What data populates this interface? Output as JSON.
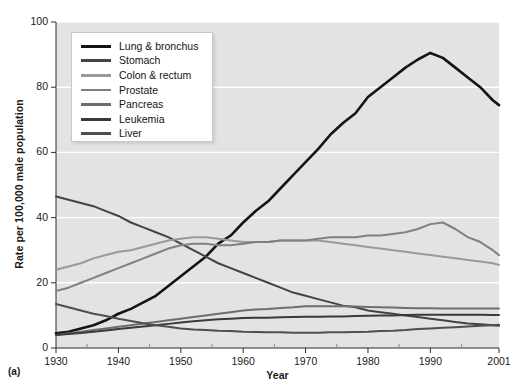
{
  "figure": {
    "panel_label": "(a)",
    "background_color": "#e3e3e3",
    "gridline_color": "#ffffff"
  },
  "chart_data": {
    "type": "line",
    "title": "",
    "xlabel": "Year",
    "ylabel": "Rate per 100,000 male population",
    "xlim": [
      1930,
      2001
    ],
    "ylim": [
      0,
      100
    ],
    "xticks": [
      1930,
      1940,
      1950,
      1960,
      1970,
      1980,
      1990,
      2001
    ],
    "yticks": [
      0,
      20,
      40,
      60,
      80,
      100
    ],
    "grid": "horizontal",
    "legend_position": "upper-left-inside",
    "x": [
      1930,
      1932,
      1934,
      1936,
      1938,
      1940,
      1942,
      1944,
      1946,
      1948,
      1950,
      1952,
      1954,
      1956,
      1958,
      1960,
      1962,
      1964,
      1966,
      1968,
      1970,
      1972,
      1974,
      1976,
      1978,
      1980,
      1982,
      1984,
      1986,
      1988,
      1990,
      1992,
      1994,
      1996,
      1998,
      2000,
      2001
    ],
    "series": [
      {
        "name": "Lung & bronchus",
        "color": "#141414",
        "values": [
          4.5,
          5.0,
          6.0,
          7.0,
          8.5,
          10.5,
          12.0,
          14.0,
          16.0,
          19.0,
          22.0,
          25.0,
          28.0,
          32.0,
          34.5,
          38.5,
          42.0,
          45.0,
          49.0,
          53.0,
          57.0,
          61.0,
          65.5,
          69.0,
          72.0,
          77.0,
          80.0,
          83.0,
          86.0,
          88.5,
          90.5,
          89.0,
          86.0,
          83.0,
          80.0,
          76.0,
          74.5
        ]
      },
      {
        "name": "Stomach",
        "color": "#434343",
        "values": [
          46.5,
          45.5,
          44.5,
          43.5,
          42.0,
          40.5,
          38.5,
          37.0,
          35.5,
          34.0,
          32.0,
          30.0,
          28.0,
          26.0,
          24.5,
          23.0,
          21.5,
          20.0,
          18.5,
          17.0,
          16.0,
          15.0,
          14.0,
          13.0,
          12.5,
          11.5,
          11.0,
          10.5,
          10.0,
          9.5,
          9.0,
          8.5,
          8.0,
          7.5,
          7.3,
          7.0,
          6.8
        ]
      },
      {
        "name": "Colon & rectum",
        "color": "#999999",
        "values": [
          24.0,
          25.0,
          26.0,
          27.5,
          28.5,
          29.5,
          30.0,
          31.0,
          32.0,
          33.0,
          33.5,
          34.0,
          34.0,
          33.5,
          33.0,
          32.5,
          32.5,
          32.5,
          33.0,
          33.0,
          33.0,
          33.0,
          32.5,
          32.0,
          31.5,
          31.0,
          30.5,
          30.0,
          29.5,
          29.0,
          28.5,
          28.0,
          27.5,
          27.0,
          26.5,
          26.0,
          25.5
        ]
      },
      {
        "name": "Prostate",
        "color": "#808080",
        "values": [
          17.5,
          18.5,
          20.0,
          21.5,
          23.0,
          24.5,
          26.0,
          27.5,
          29.0,
          30.5,
          31.5,
          32.0,
          32.0,
          31.5,
          31.5,
          32.0,
          32.5,
          32.5,
          33.0,
          33.0,
          33.0,
          33.5,
          34.0,
          34.0,
          34.0,
          34.5,
          34.5,
          35.0,
          35.5,
          36.5,
          38.0,
          38.5,
          36.5,
          34.0,
          32.5,
          30.0,
          28.5
        ]
      },
      {
        "name": "Pancreas",
        "color": "#6e6e6e",
        "values": [
          4.0,
          4.5,
          5.0,
          5.5,
          6.0,
          6.5,
          7.0,
          7.5,
          8.0,
          8.5,
          9.0,
          9.5,
          10.0,
          10.5,
          11.0,
          11.5,
          11.8,
          12.0,
          12.3,
          12.5,
          12.8,
          12.8,
          12.8,
          12.8,
          12.7,
          12.6,
          12.5,
          12.4,
          12.3,
          12.2,
          12.2,
          12.1,
          12.1,
          12.1,
          12.1,
          12.1,
          12.1
        ]
      },
      {
        "name": "Leukemia",
        "color": "#3a3a3a",
        "values": [
          4.0,
          4.3,
          4.6,
          5.0,
          5.4,
          5.8,
          6.2,
          6.6,
          7.0,
          7.4,
          7.8,
          8.2,
          8.5,
          8.8,
          9.0,
          9.2,
          9.3,
          9.3,
          9.4,
          9.5,
          9.6,
          9.6,
          9.7,
          9.7,
          9.8,
          9.9,
          10.0,
          10.0,
          10.1,
          10.2,
          10.2,
          10.2,
          10.2,
          10.2,
          10.2,
          10.1,
          10.1
        ]
      },
      {
        "name": "Liver",
        "color": "#4f4f4f",
        "values": [
          13.5,
          12.5,
          11.5,
          10.5,
          9.8,
          9.0,
          8.3,
          7.6,
          7.0,
          6.5,
          6.0,
          5.7,
          5.5,
          5.3,
          5.2,
          5.0,
          4.9,
          4.8,
          4.8,
          4.7,
          4.7,
          4.7,
          4.8,
          4.8,
          4.9,
          5.0,
          5.2,
          5.3,
          5.5,
          5.8,
          6.0,
          6.2,
          6.4,
          6.6,
          6.8,
          7.0,
          7.1
        ]
      }
    ]
  },
  "legend": {
    "items": [
      {
        "label": "Lung & bronchus",
        "color": "#141414"
      },
      {
        "label": "Stomach",
        "color": "#434343"
      },
      {
        "label": "Colon & rectum",
        "color": "#999999"
      },
      {
        "label": "Prostate",
        "color": "#808080"
      },
      {
        "label": "Pancreas",
        "color": "#6e6e6e"
      },
      {
        "label": "Leukemia",
        "color": "#3a3a3a"
      },
      {
        "label": "Liver",
        "color": "#4f4f4f"
      }
    ]
  }
}
